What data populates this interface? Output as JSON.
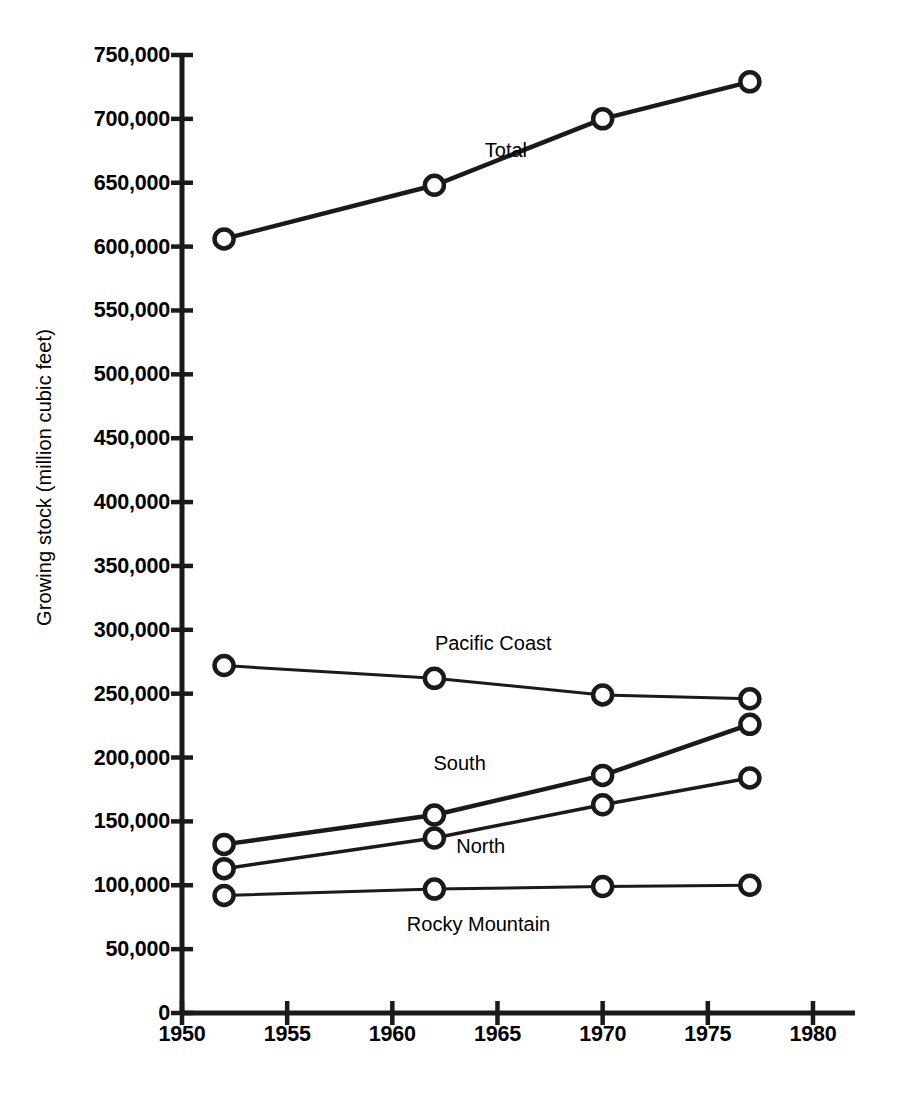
{
  "chart_data": {
    "type": "line",
    "title": "",
    "xlabel": "",
    "ylabel": "Growing stock (million cubic feet)",
    "xlim": [
      1950,
      1981
    ],
    "ylim": [
      0,
      750000
    ],
    "xticks": [
      1950,
      1955,
      1960,
      1965,
      1970,
      1975,
      1980
    ],
    "xtick_labels": [
      "1950",
      "1955",
      "1960",
      "1965",
      "1970",
      "1975",
      "1980"
    ],
    "yticks": [
      0,
      50000,
      100000,
      150000,
      200000,
      250000,
      300000,
      350000,
      400000,
      450000,
      500000,
      550000,
      600000,
      650000,
      700000,
      750000
    ],
    "ytick_labels": [
      "0",
      "50,000",
      "100,000",
      "150,000",
      "200,000",
      "250,000",
      "300,000",
      "350,000",
      "400,000",
      "450,000",
      "500,000",
      "550,000",
      "600,000",
      "650,000",
      "700,000",
      "750,000"
    ],
    "grid": false,
    "legend": "inline-annotations",
    "x": [
      1952,
      1962,
      1970,
      1977
    ],
    "series": [
      {
        "name": "Total",
        "values": [
          606000,
          648000,
          700000,
          729000
        ],
        "label_x": 1965.4,
        "label_y": 676000,
        "line_width": 4.5
      },
      {
        "name": "Pacific Coast",
        "values": [
          272000,
          262000,
          249000,
          246000
        ],
        "label_x": 1964.8,
        "label_y": 290000,
        "line_width": 3
      },
      {
        "name": "South",
        "values": [
          132000,
          155000,
          186000,
          226000
        ],
        "label_x": 1963.2,
        "label_y": 196000,
        "line_width": 4.5
      },
      {
        "name": "North",
        "values": [
          113000,
          137000,
          163000,
          184000
        ],
        "label_x": 1964.2,
        "label_y": 131000,
        "line_width": 3.5
      },
      {
        "name": "Rocky Mountain",
        "values": [
          92000,
          97000,
          99000,
          100000
        ],
        "label_x": 1964.1,
        "label_y": 70000,
        "line_width": 3
      }
    ],
    "colors": {
      "line": "#1a1a1a",
      "marker_fill": "#ffffff",
      "axis": "#1a1a1a",
      "background": "#ffffff"
    }
  }
}
